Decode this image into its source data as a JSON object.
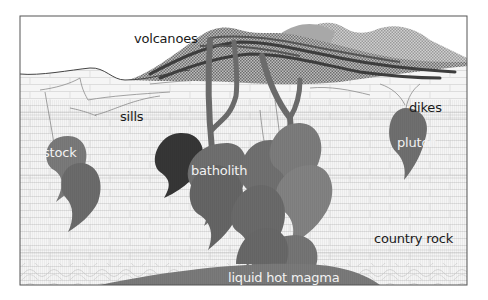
{
  "diagram": {
    "type": "geology cross-section",
    "style": "grayscale",
    "colors": {
      "background": "#ffffff",
      "frame": "#555555",
      "country_rock": "#f4f4f4",
      "rock_lines": "#c8c8c8",
      "magma_dark": "#3a3a3a",
      "magma_mid": "#6b6b6b",
      "magma_light": "#858585",
      "magma_pale": "#9a9a9a",
      "volcano_layers": "#4a4a4a",
      "text_dark": "#1a1a1a",
      "text_light": "#f2f2f2"
    },
    "labels": {
      "volcanoes": "volcanoes",
      "sills": "sills",
      "dikes": "dikes",
      "stock": "stock",
      "batholith": "batholith",
      "pluton": "pluton",
      "country_rock": "country rock",
      "liquid_hot_magma": "liquid hot magma"
    }
  }
}
